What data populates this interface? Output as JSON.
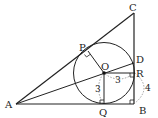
{
  "diagram": {
    "type": "geometry",
    "points": {
      "A": {
        "label": "A"
      },
      "B": {
        "label": "B"
      },
      "C": {
        "label": "C"
      },
      "D": {
        "label": "D"
      },
      "O": {
        "label": "O"
      },
      "P": {
        "label": "P"
      },
      "Q": {
        "label": "Q"
      },
      "R": {
        "label": "R"
      }
    },
    "measurements": {
      "OQ": "3",
      "OR": "3",
      "RB_arc": "4"
    },
    "right_angles": [
      "P",
      "Q",
      "R",
      "B"
    ],
    "colors": {
      "line": "#222222",
      "dashed": "#888888",
      "background": "#ffffff"
    }
  }
}
